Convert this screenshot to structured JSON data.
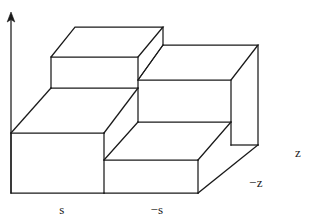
{
  "figure": {
    "background_color": "#ffffff",
    "line_color": "#1a1a1a",
    "face_color": "#ffffff"
  },
  "axes": {
    "vertical_axis": {
      "name": "vertical-axis-arrow",
      "has_arrowhead": true
    },
    "labels": [
      {
        "id": "s",
        "text": "s",
        "x": 62,
        "y": 214
      },
      {
        "id": "minus-s",
        "text": "−s",
        "x": 155,
        "y": 214
      },
      {
        "id": "z",
        "text": "z",
        "x": 296,
        "y": 157
      },
      {
        "id": "minus-z",
        "text": "−z",
        "x": 250,
        "y": 187
      }
    ]
  },
  "geometry": {
    "description": "Two-level staircase block drawn in oblique projection; upper block at left-back, lower block at right-front.",
    "upper_block": {
      "top_face": "51,57 75,27 163,27 138,57",
      "front_face": "51,57 138,57 138,88 51,88"
    },
    "lower_block": {
      "top_face": "138,80 163,45 258,45 231,80",
      "front_face": "138,80 231,80 231,145 138,145"
    },
    "base": {
      "left_front_face": "11,133 104,133 104,193 11,193",
      "right_front_face": "104,160 198,160 198,193 104,193"
    }
  }
}
